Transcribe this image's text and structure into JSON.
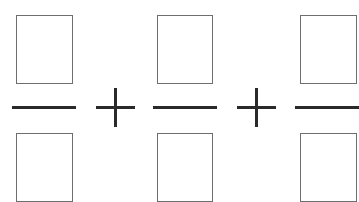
{
  "diagram": {
    "terms": [
      {
        "numerator": "",
        "denominator": ""
      },
      {
        "numerator": "",
        "denominator": ""
      },
      {
        "numerator": "",
        "denominator": ""
      }
    ],
    "operators": [
      "+",
      "+"
    ],
    "colors": {
      "box_border": "#6e6e6e",
      "line": "#2a2a2a",
      "background": "#ffffff"
    }
  }
}
